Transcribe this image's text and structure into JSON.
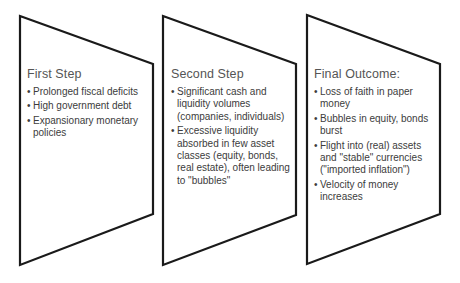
{
  "diagram": {
    "border_color": "#1a1a1a",
    "text_color": "#3c3c3c",
    "panels": [
      {
        "title": "First Step",
        "bullets": [
          "Prolonged fiscal deficits",
          "High government debt",
          "Expansionary monetary policies"
        ]
      },
      {
        "title": "Second Step",
        "bullets": [
          "Significant cash and liquidity volumes (companies, individuals)",
          "Excessive liquidity absorbed in few asset classes (equity, bonds, real estate), often leading to \"bubbles\""
        ]
      },
      {
        "title": "Final Outcome:",
        "bullets": [
          "Loss of faith in paper money",
          "Bubbles in equity, bonds burst",
          "Flight into  (real) assets and \"stable\" currencies (\"imported inflation\")",
          "Velocity of money increases"
        ]
      }
    ]
  }
}
